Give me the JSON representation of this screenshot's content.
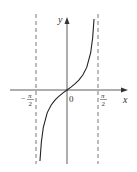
{
  "chart_data": {
    "type": "line",
    "title": "",
    "function": "y = tan(x)",
    "xlabel": "x",
    "ylabel": "y",
    "origin_label": "0",
    "asymptotes": [
      {
        "x": -1.5708,
        "label_num": "π",
        "label_den": "2",
        "sign": "−",
        "style": "dashed"
      },
      {
        "x": 1.5708,
        "label_num": "π",
        "label_den": "2",
        "sign": "",
        "style": "dashed"
      }
    ],
    "xlim": [
      -2.4,
      2.4
    ],
    "ylim": [
      -5,
      5
    ],
    "grid": false,
    "legend": null,
    "series": [
      {
        "name": "tan(x)",
        "x": [
          -1.37,
          -1.3,
          -1.2,
          -1.0,
          -0.8,
          -0.6,
          -0.4,
          -0.2,
          0,
          0.2,
          0.4,
          0.6,
          0.8,
          1.0,
          1.2,
          1.3,
          1.37
        ],
        "values": [
          -4.9,
          -3.6,
          -2.57,
          -1.56,
          -1.03,
          -0.68,
          -0.42,
          -0.2,
          0,
          0.2,
          0.42,
          0.68,
          1.03,
          1.56,
          2.57,
          3.6,
          4.9
        ]
      }
    ],
    "colors": {
      "axis": "#333333",
      "curve": "#222222",
      "asymptote": "#555555"
    }
  }
}
